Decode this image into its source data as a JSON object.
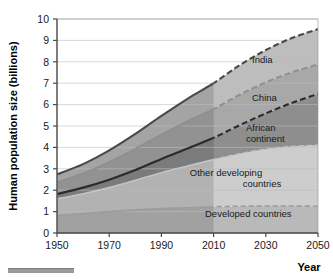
{
  "chart_data": {
    "type": "area",
    "title": "",
    "xlabel": "Year",
    "ylabel": "Human population size (billions)",
    "xlim": [
      1950,
      2050
    ],
    "ylim": [
      0,
      10
    ],
    "xticks": [
      1950,
      1970,
      1990,
      2010,
      2050
    ],
    "xtick_labels": [
      "1950",
      "1970",
      "1990",
      "2010",
      "2030",
      "2050"
    ],
    "ytick_labels": [
      "0",
      "1",
      "2",
      "3",
      "4",
      "5",
      "6",
      "7",
      "8",
      "9",
      "10"
    ],
    "yticks": [
      0,
      1,
      2,
      3,
      4,
      5,
      6,
      7,
      8,
      9,
      10
    ],
    "grid": true,
    "legend_position": "inline-right",
    "stacked": true,
    "projection_start": 2010,
    "historical_style": "solid",
    "projection_style": "dashed",
    "x": [
      1950,
      1960,
      1970,
      1980,
      1990,
      2000,
      2010,
      2020,
      2030,
      2040,
      2050
    ],
    "series": [
      {
        "name": "Developed countries",
        "label": "Developed countries",
        "color": "#b9b9b9",
        "values": [
          0.81,
          0.91,
          1.0,
          1.08,
          1.14,
          1.18,
          1.23,
          1.25,
          1.26,
          1.26,
          1.25
        ]
      },
      {
        "name": "Other developing countries",
        "label": "Other developing countries",
        "color": "#cdcdcd",
        "values": [
          0.78,
          0.92,
          1.12,
          1.38,
          1.68,
          1.95,
          2.2,
          2.45,
          2.65,
          2.78,
          2.85
        ]
      },
      {
        "name": "African continent",
        "label": "African continent",
        "color": "#8e8e8e",
        "values": [
          0.23,
          0.29,
          0.37,
          0.48,
          0.64,
          0.82,
          1.02,
          1.34,
          1.68,
          2.04,
          2.4
        ]
      },
      {
        "name": "China",
        "label": "China",
        "color": "#a8a8a8",
        "values": [
          0.55,
          0.66,
          0.82,
          0.99,
          1.14,
          1.27,
          1.34,
          1.42,
          1.45,
          1.43,
          1.38
        ]
      },
      {
        "name": "India",
        "label": "India",
        "color": "#bdbdbd",
        "values": [
          0.37,
          0.44,
          0.55,
          0.7,
          0.87,
          1.05,
          1.21,
          1.38,
          1.51,
          1.6,
          1.65
        ]
      }
    ],
    "cumulative_top": [
      2.74,
      3.22,
      3.86,
      4.63,
      5.47,
      6.27,
      7.0,
      7.84,
      8.55,
      9.11,
      9.53
    ]
  },
  "labels": {
    "india": "India",
    "china": "China",
    "african_continent_line1": "African",
    "african_continent_line2": "continent",
    "other_developing_line1": "Other developing",
    "other_developing_line2": "countries",
    "developed_countries": "Developed countries"
  },
  "axes": {
    "x_title": "Year",
    "y_title": "Human population size (billions)",
    "x_ticks": [
      "1950",
      "1970",
      "1990",
      "2010",
      "2030",
      "2050"
    ],
    "y_ticks": [
      "10",
      "9",
      "8",
      "7",
      "6",
      "5",
      "4",
      "3",
      "2",
      "1",
      "0"
    ]
  },
  "colors": {
    "band_india": "#bdbdbd",
    "band_china": "#a8a8a8",
    "band_africa": "#8e8e8e",
    "band_other_developing": "#cdcdcd",
    "band_developed": "#b9b9b9",
    "historical_overlay": "#000000",
    "gridline": "#b9bcc4",
    "axis": "#4a4a4a",
    "text": "#1a1a1a"
  }
}
